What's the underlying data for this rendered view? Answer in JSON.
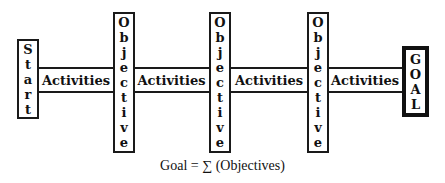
{
  "diagram": {
    "start_label": "Start",
    "goal_label": "GOAL",
    "objective_label": "Objective",
    "activities": [
      "Activities",
      "Activities",
      "Activities",
      "Activities"
    ],
    "formula": "Goal =  ∑ (Objectives)"
  }
}
